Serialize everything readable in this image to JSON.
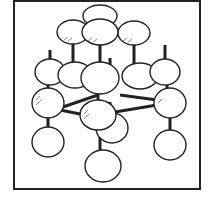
{
  "figure": {
    "colors": {
      "stroke": "#222222",
      "fill": "#ffffff",
      "frame": "#222222"
    }
  }
}
